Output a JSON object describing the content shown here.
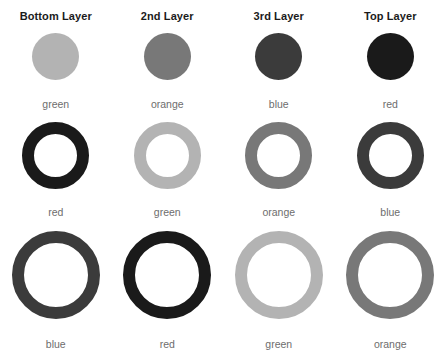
{
  "figure": {
    "background": "#ffffff",
    "headers": [
      {
        "label": "Bottom Layer"
      },
      {
        "label": "2nd Layer"
      },
      {
        "label": "3rd Layer"
      },
      {
        "label": "Top Layer"
      }
    ],
    "header_color": "#1b1b1b",
    "label_color": "#6d6d6d",
    "color_key": {
      "green": "#b3b3b3",
      "orange": "#787878",
      "blue": "#3b3b3b",
      "red": "#1a1a1a"
    },
    "rows": [
      {
        "shape": "disc",
        "cells": [
          {
            "label": "green",
            "color": "#b3b3b3"
          },
          {
            "label": "orange",
            "color": "#787878"
          },
          {
            "label": "blue",
            "color": "#3b3b3b"
          },
          {
            "label": "red",
            "color": "#1a1a1a"
          }
        ]
      },
      {
        "shape": "ring",
        "cells": [
          {
            "label": "red",
            "color": "#1a1a1a"
          },
          {
            "label": "green",
            "color": "#b3b3b3"
          },
          {
            "label": "orange",
            "color": "#787878"
          },
          {
            "label": "blue",
            "color": "#3b3b3b"
          }
        ]
      },
      {
        "shape": "ring",
        "cells": [
          {
            "label": "blue",
            "color": "#3b3b3b"
          },
          {
            "label": "red",
            "color": "#1a1a1a"
          },
          {
            "label": "green",
            "color": "#b3b3b3"
          },
          {
            "label": "orange",
            "color": "#787878"
          }
        ]
      }
    ]
  }
}
